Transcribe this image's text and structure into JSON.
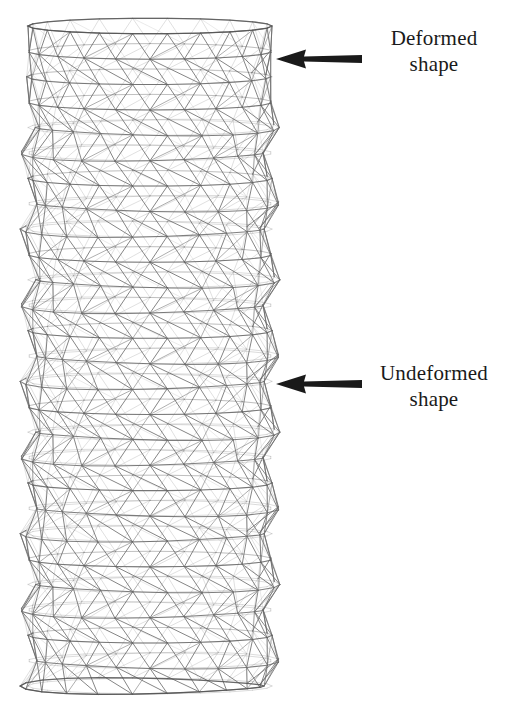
{
  "figure": {
    "background_color": "#ffffff",
    "width": 516,
    "height": 704,
    "lattice": {
      "name": "cylindrical-truss-lattice",
      "line_color": "#6e6e6e",
      "line_color_light": "#9a9a9a",
      "line_color_dark": "#545454",
      "bounds": {
        "x": 28,
        "y": 26,
        "width": 244,
        "height": 660
      },
      "rings": 26,
      "circumferential_divisions": 22,
      "deformed_top_rings": 3,
      "scallop_amplitude": 9
    },
    "annotations": [
      {
        "id": "deformed",
        "name": "deformed-shape-annotation",
        "label_line1": "Deformed",
        "label_line2": "shape",
        "arrow_color": "#1a1a1a",
        "arrow_direction": "left",
        "arrow_x": 276,
        "arrow_y": 46,
        "arrow_length": 84,
        "label_x": 364,
        "label_y": 26
      },
      {
        "id": "undeformed",
        "name": "undeformed-shape-annotation",
        "label_line1": "Undeformed",
        "label_line2": "shape",
        "arrow_color": "#1a1a1a",
        "arrow_direction": "left",
        "arrow_x": 276,
        "arrow_y": 371,
        "arrow_length": 84,
        "label_x": 356,
        "label_y": 361
      }
    ]
  }
}
